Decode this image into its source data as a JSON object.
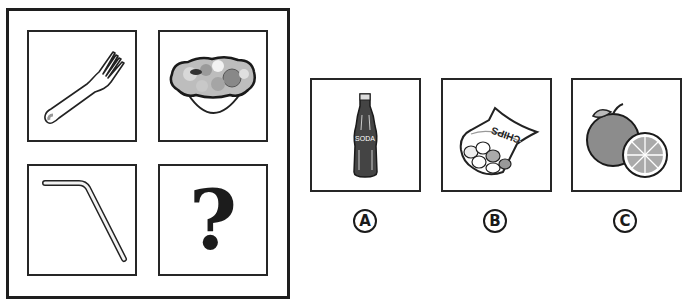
{
  "puzzle": {
    "grid": [
      {
        "id": "fork",
        "icon": "fork-icon"
      },
      {
        "id": "salad",
        "icon": "salad-bowl-icon"
      },
      {
        "id": "straw",
        "icon": "straw-icon"
      },
      {
        "id": "unknown",
        "icon": "question-mark-icon",
        "text": "?"
      }
    ]
  },
  "options": [
    {
      "label": "A",
      "icon": "soda-bottle-icon",
      "text": "SODA"
    },
    {
      "label": "B",
      "icon": "chips-bag-icon",
      "text": "CHIPS"
    },
    {
      "label": "C",
      "icon": "orange-icon"
    }
  ],
  "colors": {
    "stroke": "#262626",
    "fill_gray": "#8a8a8a",
    "background": "#ffffff"
  }
}
